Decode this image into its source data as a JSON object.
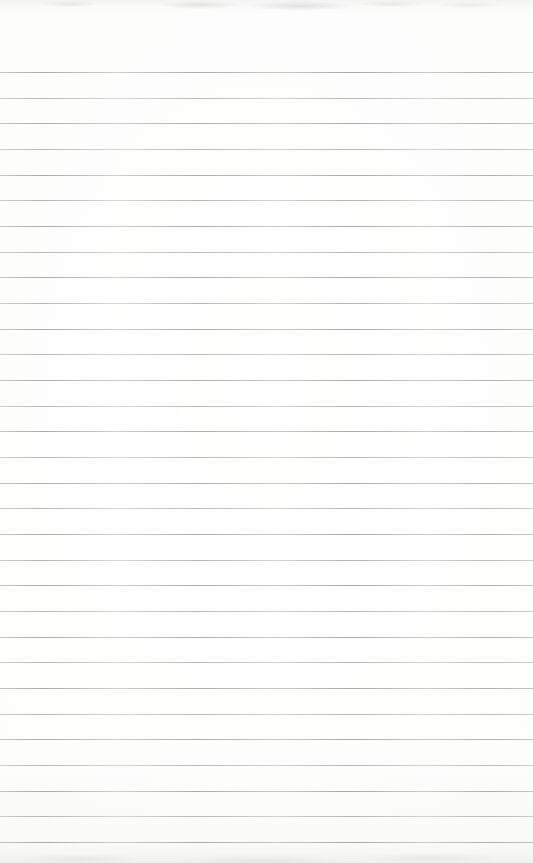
{
  "page": {
    "type": "blank-ruled-notebook-paper",
    "paper_color": "#fcfcfb",
    "bottom_edge_shade_color": "#e4e4e0",
    "top_smudge_color": "#dededa",
    "visible_text": ""
  },
  "ruled_lines": {
    "count": 31,
    "first_line_y": 72,
    "last_line_y": 842,
    "line_color": "#96978f",
    "line_thickness_px": 1
  }
}
